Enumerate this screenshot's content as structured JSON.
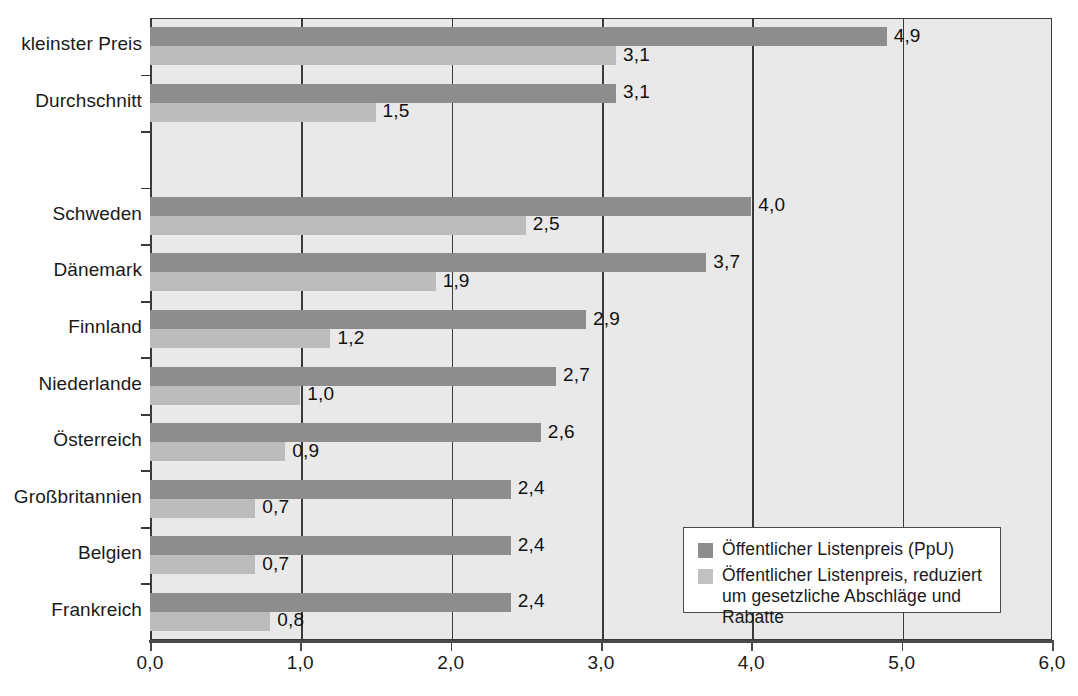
{
  "chart_data": {
    "type": "bar",
    "orientation": "horizontal",
    "title": "",
    "xlabel": "",
    "ylabel": "",
    "xlim": [
      0.0,
      6.0
    ],
    "xticks": [
      "0,0",
      "1,0",
      "2,0",
      "3,0",
      "4,0",
      "5,0",
      "6,0"
    ],
    "xtick_values": [
      0,
      1,
      2,
      3,
      4,
      5,
      6
    ],
    "grid": true,
    "grid_axis": "x",
    "legend_position": "bottom-right",
    "categories": [
      "kleinster Preis",
      "Durchschnitt",
      "",
      "Schweden",
      "Dänemark",
      "Finnland",
      "Niederlande",
      "Österreich",
      "Großbritannien",
      "Belgien",
      "Frankreich"
    ],
    "series": [
      {
        "name": "Öffentlicher Listenpreis (PpU)",
        "color": "#8d8d8d",
        "values": [
          4.9,
          3.1,
          null,
          4.0,
          3.7,
          2.9,
          2.7,
          2.6,
          2.4,
          2.4,
          2.4
        ],
        "labels": [
          "4,9",
          "3,1",
          "",
          "4,0",
          "3,7",
          "2,9",
          "2,7",
          "2,6",
          "2,4",
          "2,4",
          "2,4"
        ]
      },
      {
        "name": "Öffentlicher Listenpreis, reduziert um gesetzliche Abschläge und Rabatte",
        "color": "#bcbcbc",
        "values": [
          3.1,
          1.5,
          null,
          2.5,
          1.9,
          1.2,
          1.0,
          0.9,
          0.7,
          0.7,
          0.8
        ],
        "labels": [
          "3,1",
          "1,5",
          "",
          "2,5",
          "1,9",
          "1,2",
          "1,0",
          "0,9",
          "0,7",
          "0,7",
          "0,8"
        ]
      }
    ]
  },
  "legend": {
    "entries": [
      {
        "label": "Öffentlicher Listenpreis (PpU)",
        "color": "#8d8d8d"
      },
      {
        "label": "Öffentlicher Listenpreis, reduziert\num gesetzliche Abschläge und Rabatte",
        "color": "#c2c2c2"
      }
    ]
  },
  "colors": {
    "plot_background": "#e9e9e9",
    "axis": "#3a3a3a",
    "series_dark": "#8d8d8d",
    "series_light": "#bcbcbc",
    "text": "#1a1a1a"
  }
}
